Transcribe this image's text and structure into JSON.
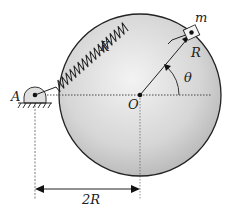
{
  "labels": {
    "pivot": "A",
    "center": "O",
    "mass": "m",
    "spring": "K",
    "radius": "R",
    "angle": "θ",
    "distance": "2R"
  },
  "colors": {
    "disk_fill_center": "#f2f2f2",
    "disk_fill_edge": "#bdbdbd",
    "stroke": "#222222",
    "background": "#ffffff"
  }
}
